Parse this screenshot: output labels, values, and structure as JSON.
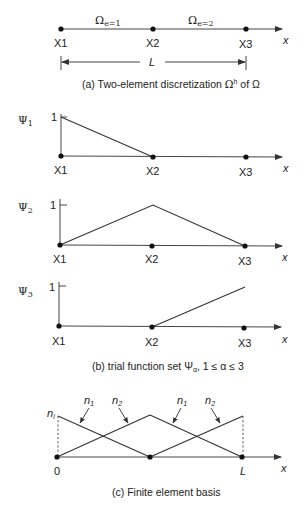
{
  "panel_a": {
    "nodes": [
      "X1",
      "X2",
      "X3"
    ],
    "elements": [
      {
        "symbol": "Ω",
        "subscript": "e=1"
      },
      {
        "symbol": "Ω",
        "subscript": "e=2"
      }
    ],
    "axis_label": "x",
    "length_label": "L",
    "caption_prefix": "(a) Two-element discretization ",
    "caption_symbol": "Ω",
    "caption_sup": "h",
    "caption_suffix": " of Ω"
  },
  "panel_b": {
    "plots": [
      {
        "symbol": "Ψ",
        "subscript": "1",
        "tick_label": "1",
        "nodes": [
          "X1",
          "X2",
          "X3"
        ],
        "values": [
          1,
          0,
          0
        ]
      },
      {
        "symbol": "Ψ",
        "subscript": "2",
        "tick_label": "1",
        "nodes": [
          "X1",
          "X2",
          "X3"
        ],
        "values": [
          0,
          1,
          0
        ]
      },
      {
        "symbol": "Ψ",
        "subscript": "3",
        "tick_label": "1",
        "nodes": [
          "X1",
          "X2",
          "X3"
        ],
        "values": [
          0,
          0,
          1
        ]
      }
    ],
    "axis_label": "x",
    "caption_prefix": "(b) trial function set Ψ",
    "caption_sub": "α",
    "caption_suffix": ", 1 ≤ α ≤ 3"
  },
  "panel_c": {
    "height_label": "n",
    "height_label_sub": "i",
    "shape_labels": [
      {
        "name": "n",
        "sub": "1"
      },
      {
        "name": "n",
        "sub": "2"
      },
      {
        "name": "n",
        "sub": "1"
      },
      {
        "name": "n",
        "sub": "2"
      }
    ],
    "start_label": "0",
    "end_label": "L",
    "axis_label": "x",
    "caption": "(c) Finite element basis"
  }
}
